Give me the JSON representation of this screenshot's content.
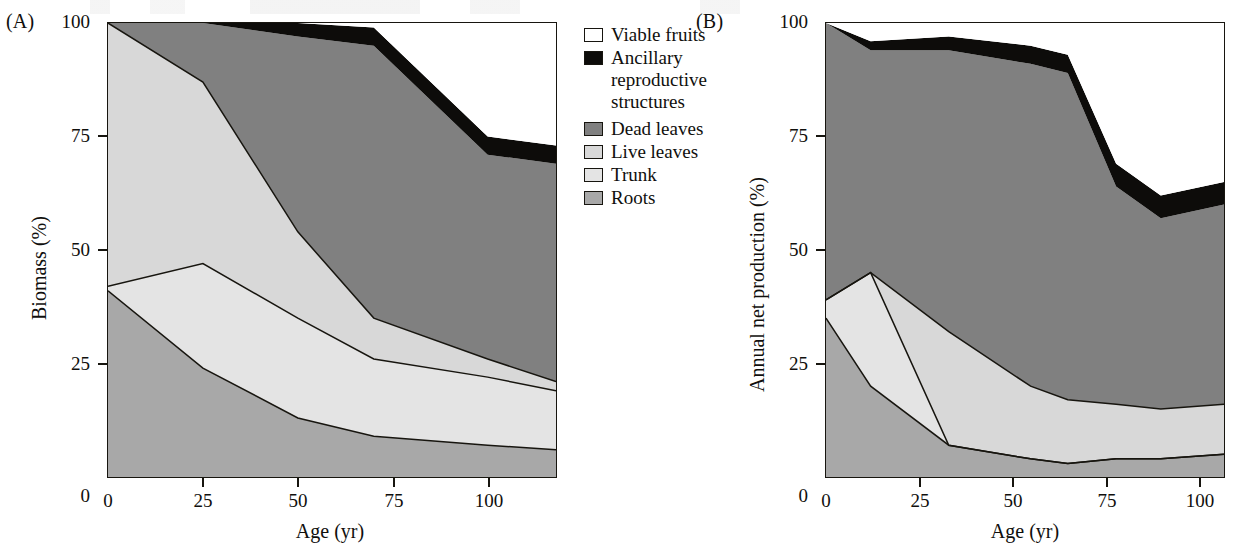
{
  "figure": {
    "panels": [
      {
        "tag": "(A)",
        "ylabel": "Biomass (%)",
        "xlabel": "Age (yr)",
        "yticks": [
          "0",
          "25",
          "50",
          "75",
          "100"
        ],
        "xticks": [
          "0",
          "25",
          "50",
          "75",
          "100"
        ]
      },
      {
        "tag": "(B)",
        "ylabel": "Annual net production (%)",
        "xlabel": "Age (yr)",
        "yticks": [
          "0",
          "25",
          "50",
          "75",
          "100"
        ],
        "xticks": [
          "0",
          "25",
          "50",
          "75",
          "100"
        ]
      }
    ]
  },
  "legend": {
    "position": "center",
    "items": [
      {
        "label": "Viable fruits",
        "color": "#ffffff",
        "key": "viable-fruits"
      },
      {
        "label": "Ancillary\nreproductive\nstructures",
        "color": "#0d0c0a",
        "key": "ancillary-reproductive-structures"
      },
      {
        "label": "Dead leaves",
        "color": "#808080",
        "key": "dead-leaves"
      },
      {
        "label": "Live leaves",
        "color": "#d8d8d8",
        "key": "live-leaves"
      },
      {
        "label": "Trunk",
        "color": "#e4e4e4",
        "key": "trunk"
      },
      {
        "label": "Roots",
        "color": "#a8a8a8",
        "key": "roots"
      }
    ]
  },
  "chart_data": [
    {
      "type": "area",
      "id": "panel-a",
      "title": "(A)",
      "xlabel": "Age (yr)",
      "ylabel": "Biomass (%)",
      "xlim": [
        0,
        118
      ],
      "ylim": [
        0,
        100
      ],
      "grid": false,
      "stacked": true,
      "stack_order_bottom_to_top": [
        "Roots",
        "Trunk",
        "Live leaves",
        "Dead leaves",
        "Ancillary reproductive structures",
        "Viable fruits"
      ],
      "x": [
        0,
        25,
        50,
        70,
        100,
        118
      ],
      "series": [
        {
          "name": "Roots",
          "color": "#a8a8a8",
          "values": [
            41,
            24,
            13,
            9,
            7,
            6
          ]
        },
        {
          "name": "Trunk",
          "color": "#e4e4e4",
          "values": [
            1,
            23,
            22,
            17,
            15,
            13
          ]
        },
        {
          "name": "Live leaves",
          "color": "#d8d8d8",
          "values": [
            58,
            40,
            19,
            9,
            4,
            2
          ]
        },
        {
          "name": "Dead leaves",
          "color": "#808080",
          "values": [
            0,
            13,
            43,
            60,
            45,
            48
          ]
        },
        {
          "name": "Ancillary reproductive structures",
          "color": "#0d0c0a",
          "values": [
            0,
            0,
            3,
            4,
            4,
            4
          ]
        },
        {
          "name": "Viable fruits",
          "color": "#ffffff",
          "values": [
            0,
            0,
            0,
            1,
            25,
            27
          ]
        }
      ],
      "cumulative_boundaries": {
        "roots_top": [
          41,
          24,
          13,
          9,
          7,
          6
        ],
        "trunk_top": [
          42,
          47,
          35,
          26,
          22,
          19
        ],
        "live_leaves_top": [
          100,
          87,
          54,
          35,
          26,
          21
        ],
        "dead_leaves_top": [
          100,
          100,
          97,
          95,
          71,
          69
        ],
        "ancillary_top": [
          100,
          100,
          100,
          99,
          75,
          73
        ]
      }
    },
    {
      "type": "area",
      "id": "panel-b",
      "title": "(B)",
      "xlabel": "Age (yr)",
      "ylabel": "Annual net production (%)",
      "xlim": [
        0,
        107
      ],
      "ylim": [
        0,
        100
      ],
      "grid": false,
      "stacked": true,
      "stack_order_bottom_to_top": [
        "Roots",
        "Trunk",
        "Live leaves",
        "Dead leaves",
        "Ancillary reproductive structures",
        "Viable fruits"
      ],
      "x": [
        0,
        12,
        33,
        55,
        65,
        78,
        90,
        107
      ],
      "series": [
        {
          "name": "Roots",
          "color": "#a8a8a8",
          "values": [
            35,
            20,
            7,
            4,
            3,
            4,
            4,
            5
          ]
        },
        {
          "name": "Trunk",
          "color": "#e4e4e4",
          "values": [
            4,
            25,
            0,
            0,
            0,
            0,
            0,
            0
          ]
        },
        {
          "name": "Live leaves",
          "color": "#d8d8d8",
          "values": [
            0,
            0,
            25,
            16,
            14,
            12,
            11,
            11
          ]
        },
        {
          "name": "Dead leaves",
          "color": "#808080",
          "values": [
            61,
            49,
            62,
            71,
            72,
            48,
            42,
            44
          ]
        },
        {
          "name": "Ancillary reproductive structures",
          "color": "#0d0c0a",
          "values": [
            0,
            2,
            3,
            4,
            4,
            5,
            5,
            5
          ]
        },
        {
          "name": "Viable fruits",
          "color": "#ffffff",
          "values": [
            0,
            4,
            3,
            5,
            7,
            31,
            38,
            35
          ]
        }
      ],
      "cumulative_boundaries": {
        "roots_top": [
          35,
          20,
          7,
          4,
          3,
          4,
          4,
          5
        ],
        "trunk_top": [
          39,
          45,
          32,
          20,
          17,
          16,
          15,
          16
        ],
        "live_leaves_top": [
          39,
          45,
          32,
          20,
          17,
          16,
          15,
          16
        ],
        "dead_leaves_top": [
          100,
          94,
          94,
          91,
          89,
          60,
          60,
          60
        ],
        "ancillary_top": [
          100,
          96,
          97,
          95,
          93,
          65,
          65,
          65
        ]
      }
    }
  ]
}
